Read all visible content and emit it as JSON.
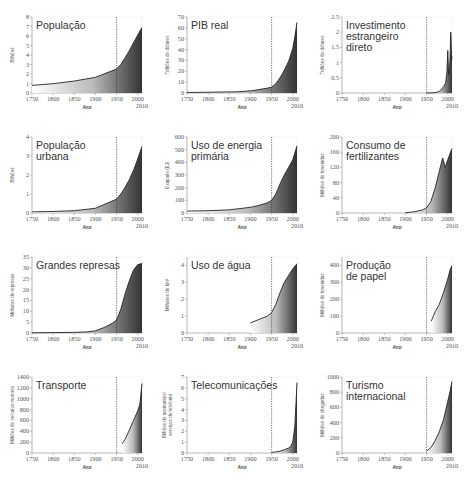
{
  "chart_data": [
    {
      "id": "populacao",
      "type": "area",
      "title": "População",
      "title_lines": [
        "População"
      ],
      "ylabel": "Bilhões",
      "ylabel_lines": [
        "Bilhões"
      ],
      "xlabel": "Ano",
      "ylim": [
        0,
        8
      ],
      "yticks": [
        0,
        1,
        2,
        3,
        4,
        5,
        6,
        7,
        8
      ],
      "xticks": [
        1750,
        1800,
        1850,
        1900,
        1950,
        2000
      ],
      "xmax_label": 2010,
      "marker_year": 1950,
      "x": [
        1750,
        1800,
        1850,
        1900,
        1950,
        1960,
        1970,
        1980,
        1990,
        2000,
        2010
      ],
      "values": [
        0.8,
        0.98,
        1.26,
        1.65,
        2.52,
        3.02,
        3.7,
        4.45,
        5.3,
        6.1,
        6.9
      ]
    },
    {
      "id": "pib_real",
      "type": "area",
      "title": "PIB real",
      "title_lines": [
        "PIB real"
      ],
      "ylabel": "Trilhões de dólares",
      "ylabel_lines": [
        "Trilhões de dólares"
      ],
      "xlabel": "Ano",
      "ylim": [
        0,
        70
      ],
      "yticks": [
        0,
        10,
        20,
        30,
        40,
        50,
        60,
        70
      ],
      "xticks": [
        1750,
        1800,
        1850,
        1900,
        1950,
        2000
      ],
      "xmax_label": 2010,
      "marker_year": 1950,
      "x": [
        1750,
        1800,
        1850,
        1870,
        1900,
        1913,
        1940,
        1950,
        1960,
        1970,
        1980,
        1990,
        2000,
        2005,
        2010
      ],
      "values": [
        0.5,
        0.7,
        1.0,
        1.1,
        2.0,
        2.7,
        4.5,
        5.3,
        8.5,
        14,
        21,
        29,
        41,
        52,
        65
      ]
    },
    {
      "id": "ide",
      "type": "area",
      "title": "Investimento estrangeiro direto",
      "title_lines": [
        "Investimento",
        "estrangeiro",
        "direto"
      ],
      "ylabel": "Trilhões de dólares",
      "ylabel_lines": [
        "Trilhões de dólares"
      ],
      "xlabel": "Ano",
      "ylim": [
        0,
        2.5
      ],
      "yticks": [
        0,
        0.5,
        1,
        1.5,
        2,
        2.5
      ],
      "xticks": [
        1750,
        1800,
        1850,
        1900,
        1950,
        2000
      ],
      "xmax_label": 2010,
      "marker_year": 1950,
      "x": [
        1950,
        1970,
        1980,
        1990,
        1995,
        1998,
        2000,
        2002,
        2004,
        2006,
        2007,
        2008,
        2009,
        2010
      ],
      "values": [
        0.0,
        0.01,
        0.05,
        0.2,
        0.33,
        0.7,
        1.4,
        0.6,
        0.7,
        1.4,
        2.0,
        1.7,
        1.1,
        1.2
      ]
    },
    {
      "id": "populacao_urbana",
      "type": "area",
      "title": "População urbana",
      "title_lines": [
        "População",
        "urbana"
      ],
      "ylabel": "Bilhões",
      "ylabel_lines": [
        "Bilhões"
      ],
      "xlabel": "Ano",
      "ylim": [
        0,
        4
      ],
      "yticks": [
        0,
        1,
        2,
        3,
        4
      ],
      "xticks": [
        1750,
        1800,
        1850,
        1900,
        1950,
        2000
      ],
      "xmax_label": 2010,
      "marker_year": 1950,
      "x": [
        1750,
        1800,
        1850,
        1900,
        1950,
        1960,
        1970,
        1980,
        1990,
        2000,
        2010
      ],
      "values": [
        0.06,
        0.08,
        0.12,
        0.25,
        0.73,
        1.0,
        1.35,
        1.75,
        2.25,
        2.85,
        3.5
      ]
    },
    {
      "id": "energia",
      "type": "area",
      "title": "Uso de energia primária",
      "title_lines": [
        "Uso de energia",
        "primária"
      ],
      "ylabel": "Exajoule (EJ)",
      "ylabel_lines": [
        "Exajoule (EJ)"
      ],
      "xlabel": "Ano",
      "ylim": [
        0,
        600
      ],
      "yticks": [
        0,
        100,
        200,
        300,
        400,
        500,
        600
      ],
      "xticks": [
        1750,
        1800,
        1850,
        1900,
        1950,
        2000
      ],
      "xmax_label": 2010,
      "marker_year": 1950,
      "x": [
        1750,
        1800,
        1850,
        1900,
        1920,
        1940,
        1950,
        1960,
        1970,
        1980,
        1990,
        2000,
        2010
      ],
      "values": [
        15,
        18,
        25,
        45,
        60,
        80,
        100,
        150,
        230,
        300,
        360,
        420,
        530
      ]
    },
    {
      "id": "fertilizantes",
      "type": "area",
      "title": "Consumo de fertilizantes",
      "title_lines": [
        "Consumo de",
        "fertilizantes"
      ],
      "ylabel": "Milhões de toneladas",
      "ylabel_lines": [
        "Milhões de toneladas"
      ],
      "xlabel": "Ano",
      "ylim": [
        0,
        200
      ],
      "yticks": [
        0,
        40,
        80,
        120,
        160,
        200
      ],
      "xticks": [
        1750,
        1800,
        1850,
        1900,
        1950,
        2000
      ],
      "xmax_label": 2010,
      "marker_year": 1950,
      "x": [
        1900,
        1920,
        1940,
        1950,
        1960,
        1970,
        1980,
        1988,
        1994,
        2000,
        2010
      ],
      "values": [
        1,
        3,
        8,
        14,
        30,
        65,
        110,
        145,
        120,
        140,
        170
      ]
    },
    {
      "id": "represas",
      "type": "area",
      "title": "Grandes represas",
      "title_lines": [
        "Grandes represas"
      ],
      "ylabel": "Milhares de represas",
      "ylabel_lines": [
        "Milhares de represas"
      ],
      "xlabel": "Ano",
      "ylim": [
        0,
        35
      ],
      "yticks": [
        0,
        5,
        10,
        15,
        20,
        25,
        30,
        35
      ],
      "xticks": [
        1750,
        1800,
        1850,
        1900,
        1950,
        2000
      ],
      "xmax_label": 2010,
      "marker_year": 1950,
      "x": [
        1750,
        1800,
        1850,
        1880,
        1900,
        1920,
        1940,
        1950,
        1960,
        1970,
        1980,
        1990,
        2000,
        2010
      ],
      "values": [
        0.1,
        0.2,
        0.3,
        0.5,
        1,
        2.5,
        4.5,
        6,
        11,
        18,
        24,
        29,
        31.5,
        32
      ]
    },
    {
      "id": "agua",
      "type": "area",
      "title": "Uso de água",
      "title_lines": [
        "Uso de água"
      ],
      "ylabel": "Milhares de km³",
      "ylabel_lines": [
        "Milhares de km³"
      ],
      "xlabel": "Ano",
      "ylim": [
        0,
        4.5
      ],
      "yticks": [
        0,
        1,
        2,
        3,
        4
      ],
      "xticks": [
        1750,
        1800,
        1850,
        1900,
        1950,
        2000
      ],
      "xmax_label": 2010,
      "marker_year": 1950,
      "x": [
        1900,
        1920,
        1940,
        1950,
        1960,
        1970,
        1980,
        1990,
        2000,
        2010
      ],
      "values": [
        0.6,
        0.8,
        1.0,
        1.2,
        1.7,
        2.4,
        3.0,
        3.4,
        3.8,
        4.1
      ]
    },
    {
      "id": "papel",
      "type": "area",
      "title": "Produção de papel",
      "title_lines": [
        "Produção",
        "de papel"
      ],
      "ylabel": "Milhões de toneladas",
      "ylabel_lines": [
        "Milhões de toneladas"
      ],
      "xlabel": "Ano",
      "ylim": [
        0,
        450
      ],
      "yticks": [
        0,
        100,
        200,
        300,
        400
      ],
      "xticks": [
        1750,
        1800,
        1850,
        1900,
        1950,
        2000
      ],
      "xmax_label": 2010,
      "marker_year": 1950,
      "x": [
        1961,
        1970,
        1980,
        1990,
        2000,
        2005,
        2010
      ],
      "values": [
        70,
        125,
        170,
        240,
        320,
        370,
        400
      ]
    },
    {
      "id": "transporte",
      "type": "area",
      "title": "Transporte",
      "title_lines": [
        "Transporte"
      ],
      "ylabel": "Milhões de veículos motores",
      "ylabel_lines": [
        "Milhões de veículos motores"
      ],
      "xlabel": "Ano",
      "ylim": [
        0,
        1400
      ],
      "yticks": [
        0,
        200,
        400,
        600,
        800,
        1000,
        1200,
        1400
      ],
      "xticks": [
        1750,
        1800,
        1850,
        1900,
        1950,
        2000
      ],
      "xmax_label": 2010,
      "marker_year": 1950,
      "x": [
        1963,
        1970,
        1980,
        1990,
        2000,
        2005,
        2010
      ],
      "values": [
        170,
        250,
        420,
        600,
        780,
        900,
        1280
      ]
    },
    {
      "id": "telecom",
      "type": "area",
      "title": "Telecomunicações",
      "title_lines": [
        "Telecomunicações"
      ],
      "ylabel": "Bilhões de assinantes/serviços de telefonia",
      "ylabel_lines": [
        "Bilhões de assinantes/",
        "serviços de telefonia"
      ],
      "xlabel": "Ano",
      "ylim": [
        0,
        7
      ],
      "yticks": [
        0,
        1,
        2,
        3,
        4,
        5,
        6,
        7
      ],
      "xticks": [
        1750,
        1800,
        1850,
        1900,
        1950,
        2000
      ],
      "xmax_label": 2010,
      "marker_year": 1950,
      "x": [
        1950,
        1960,
        1970,
        1980,
        1990,
        1995,
        2000,
        2005,
        2010
      ],
      "values": [
        0.05,
        0.1,
        0.17,
        0.3,
        0.45,
        0.6,
        1.0,
        2.5,
        6.5
      ]
    },
    {
      "id": "turismo",
      "type": "area",
      "title": "Turismo internacional",
      "title_lines": [
        "Turismo",
        "internacional"
      ],
      "ylabel": "Milhões de chegadas",
      "ylabel_lines": [
        "Milhões de chegadas"
      ],
      "xlabel": "Ano",
      "ylim": [
        0,
        1000
      ],
      "yticks": [
        0,
        200,
        400,
        600,
        800,
        1000
      ],
      "xticks": [
        1750,
        1800,
        1850,
        1900,
        1950,
        2000
      ],
      "xmax_label": 2010,
      "marker_year": 1950,
      "x": [
        1950,
        1960,
        1970,
        1980,
        1990,
        2000,
        2005,
        2010
      ],
      "values": [
        25,
        70,
        160,
        280,
        440,
        680,
        800,
        940
      ]
    }
  ],
  "colors": {
    "axis": "#888888",
    "line": "#222222",
    "fill_dark": "#333333",
    "fill_light": "#ffffff",
    "marker": "#333333"
  }
}
